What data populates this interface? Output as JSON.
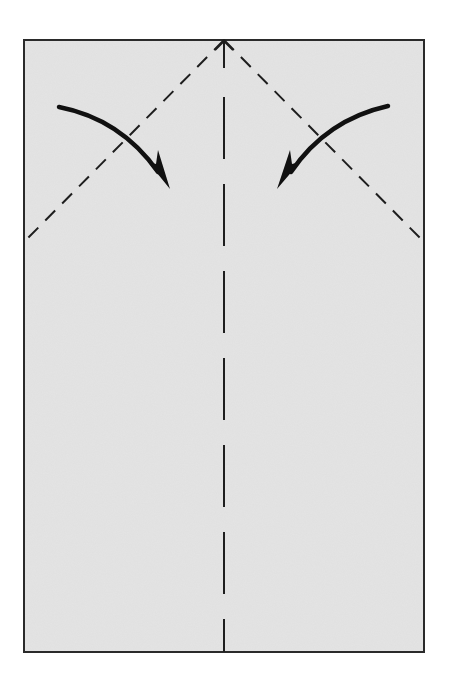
{
  "diagram": {
    "type": "origami-folding-step",
    "colors": {
      "paper": "#e4e4e4",
      "outline": "#2a2a2a",
      "fold_line": "#1e1e1e",
      "arrow": "#111111",
      "background": "#ffffff"
    },
    "paper": {
      "x": 24,
      "y": 40,
      "width": 400,
      "height": 612
    },
    "center_crease": {
      "x": 224,
      "y1": 40,
      "y2": 652,
      "style": "long-dash",
      "dash": [
        62,
        25
      ]
    },
    "fold_lines": [
      {
        "name": "left-diagonal-valley-fold",
        "from": [
          224,
          40
        ],
        "to": [
          24,
          242
        ],
        "style": "dashed"
      },
      {
        "name": "right-diagonal-valley-fold",
        "from": [
          224,
          40
        ],
        "to": [
          424,
          242
        ],
        "style": "dashed"
      }
    ],
    "arrows": [
      {
        "name": "left-corner-fold-arrow",
        "direction": "down-right",
        "meaning": "fold top-left corner to center"
      },
      {
        "name": "right-corner-fold-arrow",
        "direction": "down-left",
        "meaning": "fold top-right corner to center"
      }
    ]
  }
}
